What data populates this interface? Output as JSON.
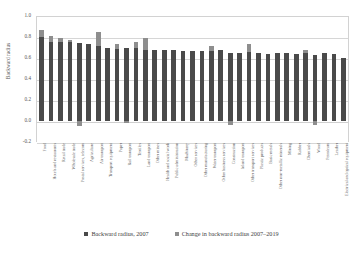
{
  "chart_data": {
    "type": "bar",
    "title": "",
    "subtitle": "",
    "xlabel": "",
    "ylabel": "Backward radius",
    "ylim": [
      -0.2,
      1.0
    ],
    "yticks": [
      "1.0",
      "0.8",
      "0.6",
      "0.4",
      "0.2",
      "0.0",
      "-0.2"
    ],
    "ytick_values": [
      1.0,
      0.8,
      0.6,
      0.4,
      0.2,
      0.0,
      -0.2
    ],
    "grid": true,
    "stacked": true,
    "legend_position": "bottom",
    "legend": [
      "Backward radius, 2007",
      "Change in backward radius 2007–2019"
    ],
    "colors": {
      "base": "#4a4a4a",
      "change": "#8e8e8e",
      "grid": "#d6d6d6",
      "text": "#555555"
    },
    "categories": [
      "Food",
      "Hotels and restaurants",
      "Retail trade",
      "Wholesale trade",
      "Postal services, telecom",
      "Agriculture",
      "Air transport",
      "Transport equipment",
      "Paper",
      "Rail transport",
      "Textiles",
      "Land transport",
      "Other mines",
      "Health and social work",
      "Public administration",
      "Machinery",
      "Other services",
      "Other manufacturing",
      "Water transport",
      "Other business services",
      "Construction",
      "Inland transport",
      "Other transport services",
      "Plastic products",
      "Basic metals",
      "Other non-metallic minerals",
      "Mining",
      "Rubber",
      "Chemicals",
      "Wood",
      "Petroleum",
      "Leather",
      "Electrical and optical equipment"
    ],
    "series": [
      {
        "name": "Backward radius, 2007",
        "values": [
          0.8,
          0.75,
          0.75,
          0.75,
          0.74,
          0.73,
          0.71,
          0.7,
          0.69,
          0.7,
          0.7,
          0.68,
          0.68,
          0.68,
          0.68,
          0.67,
          0.67,
          0.67,
          0.67,
          0.68,
          0.65,
          0.65,
          0.66,
          0.65,
          0.64,
          0.65,
          0.65,
          0.64,
          0.65,
          0.63,
          0.65,
          0.64,
          0.6
        ]
      },
      {
        "name": "Change in backward radius 2007–2019",
        "values": [
          0.07,
          0.06,
          0.04,
          0.02,
          -0.05,
          0.0,
          0.14,
          0.0,
          0.04,
          -0.02,
          0.05,
          0.11,
          0.0,
          0.0,
          0.0,
          0.0,
          0.0,
          0.0,
          0.04,
          0.0,
          -0.04,
          0.0,
          0.07,
          0.0,
          0.0,
          0.0,
          0.0,
          0.0,
          0.03,
          -0.04,
          0.0,
          0.0,
          0.0
        ]
      }
    ]
  }
}
